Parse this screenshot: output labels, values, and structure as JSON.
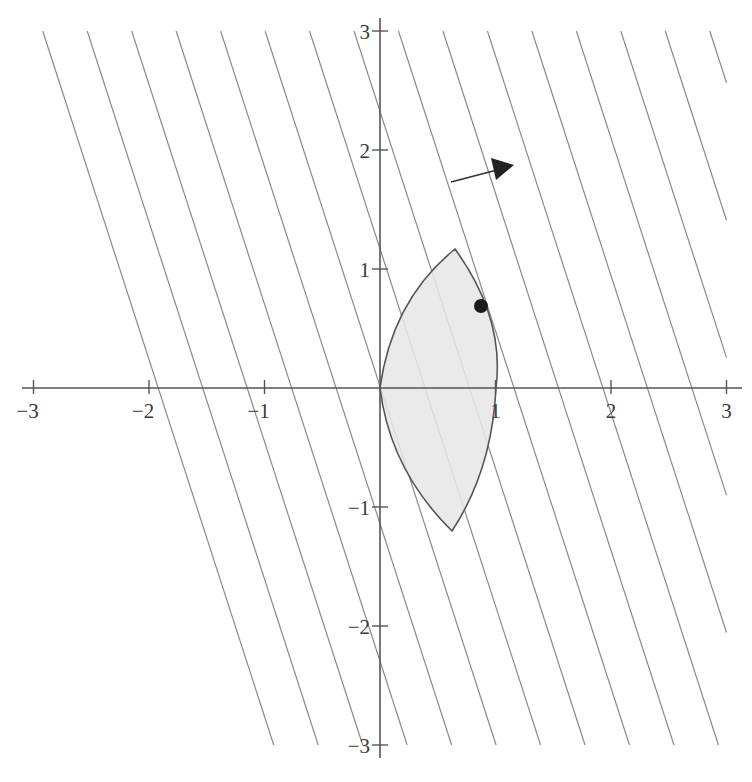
{
  "figure": {
    "colors": {
      "axis": "#555555",
      "level_line": "#8a8a8a",
      "region_fill": "#e6e6e6",
      "region_stroke": "#555555",
      "point": "#1a1a1a",
      "arrow": "#333333"
    },
    "x_axis": {
      "range": [
        -3,
        3
      ],
      "ticks": [
        {
          "value": -3,
          "label": "−3"
        },
        {
          "value": -2,
          "label": "−2"
        },
        {
          "value": -1,
          "label": "−1"
        },
        {
          "value": 1,
          "label": "1"
        },
        {
          "value": 2,
          "label": "2"
        },
        {
          "value": 3,
          "label": "3"
        }
      ]
    },
    "y_axis": {
      "range": [
        -3,
        3
      ],
      "ticks": [
        {
          "value": 3,
          "label": "3"
        },
        {
          "value": 2,
          "label": "2"
        },
        {
          "value": 1,
          "label": "1"
        },
        {
          "value": -1,
          "label": "−1"
        },
        {
          "value": -2,
          "label": "−2"
        },
        {
          "value": -3,
          "label": "−3"
        }
      ]
    },
    "region": {
      "vertices": [
        [
          0,
          0
        ],
        [
          0.65,
          1.17
        ],
        [
          0.63,
          -1.2
        ]
      ],
      "rightmost_axis_crossing": [
        1,
        0
      ]
    },
    "optimal_point": {
      "x": 0.87,
      "y": 0.7
    },
    "direction_arrow": {
      "from": [
        0.6,
        1.72
      ],
      "to": [
        1.15,
        1.88
      ]
    },
    "level_lines": {
      "normal": [
        3,
        1
      ],
      "count": 16
    }
  }
}
